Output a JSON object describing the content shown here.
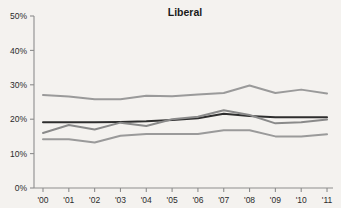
{
  "chart_data": {
    "type": "line",
    "title": "Liberal",
    "xlabel": "",
    "ylabel": "",
    "x": [
      "'00",
      "'01",
      "'02",
      "'03",
      "'04",
      "'05",
      "'06",
      "'07",
      "'08",
      "'09",
      "'10",
      "'11"
    ],
    "categories": [
      "'00",
      "'01",
      "'02",
      "'03",
      "'04",
      "'05",
      "'06",
      "'07",
      "'08",
      "'09",
      "'10",
      "'11"
    ],
    "ylim": [
      0,
      50
    ],
    "yticks": [
      0,
      10,
      20,
      30,
      40,
      50
    ],
    "ytick_labels": [
      "0%",
      "10%",
      "20%",
      "30%",
      "40%",
      "50%"
    ],
    "grid": false,
    "legend": "none",
    "series": [
      {
        "name": "upper-gray-line",
        "color": "#9a9a9a",
        "width": 2.0,
        "values": [
          27.0,
          26.6,
          25.8,
          25.8,
          26.8,
          26.7,
          27.2,
          27.6,
          29.8,
          27.6,
          28.6,
          27.5
        ]
      },
      {
        "name": "dark-flat-line",
        "color": "#2e2e2e",
        "width": 2.0,
        "values": [
          19.1,
          19.1,
          19.1,
          19.2,
          19.4,
          19.8,
          20.3,
          21.6,
          20.9,
          20.6,
          20.6,
          20.6
        ]
      },
      {
        "name": "mid-gray-line",
        "color": "#8a8a8a",
        "width": 2.0,
        "values": [
          16.0,
          18.3,
          17.0,
          19.0,
          18.0,
          20.0,
          20.7,
          22.6,
          21.2,
          18.8,
          19.1,
          19.9
        ]
      },
      {
        "name": "lower-gray-line",
        "color": "#9a9a9a",
        "width": 2.0,
        "values": [
          14.2,
          14.2,
          13.2,
          15.2,
          15.7,
          15.7,
          15.7,
          16.8,
          16.8,
          15.0,
          15.0,
          15.6
        ]
      }
    ]
  },
  "axes": {
    "x_axis_name": "year-axis",
    "y_axis_name": "percent-axis"
  },
  "colors": {
    "background": "#f4f2ef",
    "axis": "#8d8d8d",
    "text": "#1a1a1a"
  }
}
